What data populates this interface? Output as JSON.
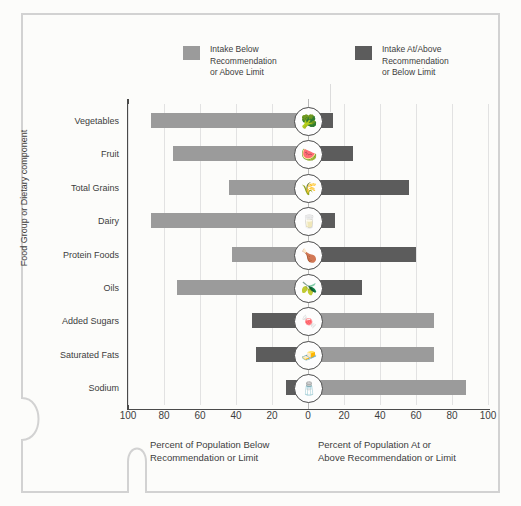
{
  "legend": {
    "items": [
      {
        "label": "Intake Below\nRecommendation\nor Above Limit",
        "color": "#9b9b9b",
        "name": "intake-below"
      },
      {
        "label": "Intake At/Above\nRecommendation\nor Below Limit",
        "color": "#5c5c5c",
        "name": "intake-at-above"
      }
    ]
  },
  "axes": {
    "y_title": "Food Group or Dietary component",
    "x_ticks": [
      "100",
      "80",
      "60",
      "40",
      "20",
      "0",
      "20",
      "40",
      "60",
      "80",
      "100"
    ],
    "x_caption_left": "Percent of Population  Below\nRecommendation  or Limit",
    "x_caption_right": "Percent of Population At or\nAbove Recommendation or Limit"
  },
  "chart_data": {
    "type": "bar",
    "orientation": "horizontal-diverging",
    "title": "",
    "xlabel": "Percent of Population",
    "ylabel": "Food Group or Dietary component",
    "xlim": [
      -100,
      100
    ],
    "grid": true,
    "legend_position": "top",
    "categories": [
      "Vegetables",
      "Fruit",
      "Total Grains",
      "Dairy",
      "Protein Foods",
      "Oils",
      "Added Sugars",
      "Saturated Fats",
      "Sodium"
    ],
    "series": [
      {
        "name": "Intake Below Recommendation or Above Limit",
        "color": "#9b9b9b",
        "values": [
          87,
          75,
          44,
          87,
          42,
          73,
          70,
          70,
          88
        ]
      },
      {
        "name": "Intake At/Above Recommendation or Below Limit",
        "color": "#5c5c5c",
        "values": [
          14,
          25,
          56,
          15,
          60,
          30,
          31,
          29,
          12
        ]
      }
    ],
    "rows": [
      {
        "category": "Vegetables",
        "left_value": 87,
        "right_value": 14,
        "left_color": "#9b9b9b",
        "right_color": "#5c5c5c",
        "icon": "vegetables-icon",
        "glyph": "🥦"
      },
      {
        "category": "Fruit",
        "left_value": 75,
        "right_value": 25,
        "left_color": "#9b9b9b",
        "right_color": "#5c5c5c",
        "icon": "fruit-icon",
        "glyph": "🍉"
      },
      {
        "category": "Total Grains",
        "left_value": 44,
        "right_value": 56,
        "left_color": "#9b9b9b",
        "right_color": "#5c5c5c",
        "icon": "grains-icon",
        "glyph": "🌾"
      },
      {
        "category": "Dairy",
        "left_value": 87,
        "right_value": 15,
        "left_color": "#9b9b9b",
        "right_color": "#5c5c5c",
        "icon": "dairy-icon",
        "glyph": "🥛"
      },
      {
        "category": "Protein Foods",
        "left_value": 42,
        "right_value": 60,
        "left_color": "#9b9b9b",
        "right_color": "#5c5c5c",
        "icon": "protein-foods-icon",
        "glyph": "🍗"
      },
      {
        "category": "Oils",
        "left_value": 73,
        "right_value": 30,
        "left_color": "#9b9b9b",
        "right_color": "#5c5c5c",
        "icon": "oils-icon",
        "glyph": "🫒"
      },
      {
        "category": "Added Sugars",
        "left_value": 31,
        "right_value": 70,
        "left_color": "#5c5c5c",
        "right_color": "#9b9b9b",
        "icon": "added-sugars-icon",
        "glyph": "🍬"
      },
      {
        "category": "Saturated Fats",
        "left_value": 29,
        "right_value": 70,
        "left_color": "#5c5c5c",
        "right_color": "#9b9b9b",
        "icon": "saturated-fats-icon",
        "glyph": "🧈"
      },
      {
        "category": "Sodium",
        "left_value": 12,
        "right_value": 88,
        "left_color": "#5c5c5c",
        "right_color": "#9b9b9b",
        "icon": "sodium-icon",
        "glyph": "🧂"
      }
    ]
  }
}
